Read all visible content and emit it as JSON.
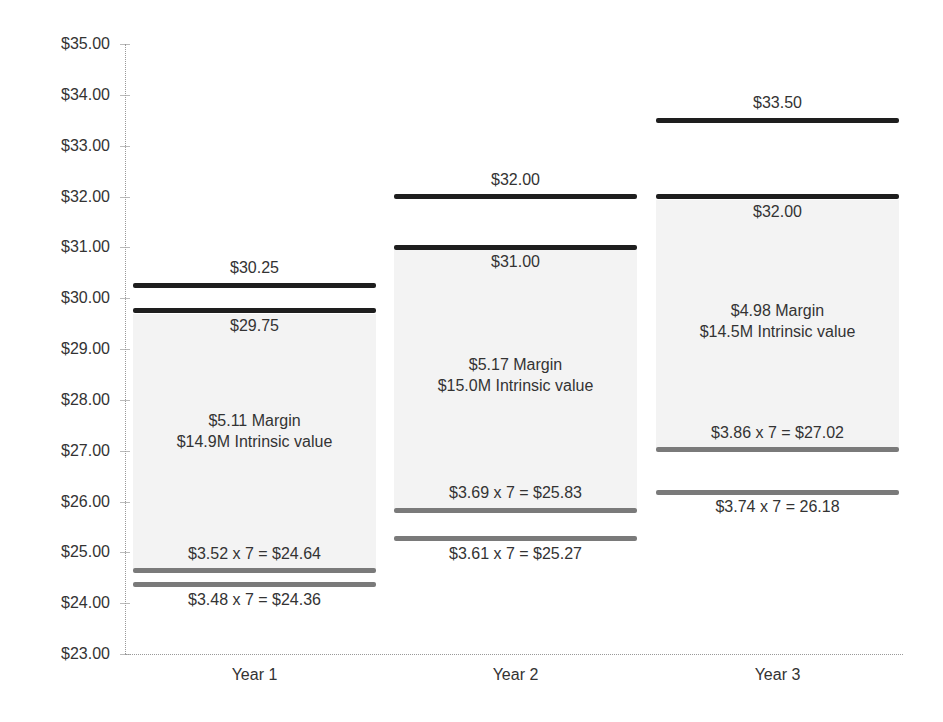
{
  "chart_data": {
    "type": "range-bar",
    "title": "",
    "xlabel": "",
    "ylabel": "",
    "ylim": [
      23,
      35
    ],
    "grid": false,
    "legend": null,
    "y_ticks": [
      "$35.00",
      "$34.00",
      "$33.00",
      "$32.00",
      "$31.00",
      "$30.00",
      "$29.00",
      "$28.00",
      "$27.00",
      "$26.00",
      "$25.00",
      "$24.00",
      "$23.00"
    ],
    "categories": [
      "Year 1",
      "Year 2",
      "Year 3"
    ],
    "series": [
      {
        "name": "Price high",
        "values": [
          30.25,
          32.0,
          33.5
        ],
        "labels": [
          "$30.25",
          "$32.00",
          "$33.50"
        ]
      },
      {
        "name": "Price low",
        "values": [
          29.75,
          31.0,
          32.0
        ],
        "labels": [
          "$29.75",
          "$31.00",
          "$32.00"
        ]
      },
      {
        "name": "Value high (EPS x 7)",
        "values": [
          24.64,
          25.83,
          27.02
        ],
        "labels": [
          "$3.52 x 7 = $24.64",
          "$3.69 x 7 = $25.83",
          "$3.86 x 7 = $27.02"
        ]
      },
      {
        "name": "Value low (EPS x 7)",
        "values": [
          24.36,
          25.27,
          26.18
        ],
        "labels": [
          "$3.48 x 7 = $24.36",
          "$3.61 x 7 = $25.27",
          "$3.74 x 7 = 26.18"
        ]
      }
    ],
    "annotations": [
      {
        "category": "Year 1",
        "margin": "$5.11 Margin",
        "intrinsic": "$14.9M Intrinsic value"
      },
      {
        "category": "Year 2",
        "margin": "$5.17 Margin",
        "intrinsic": "$15.0M Intrinsic value"
      },
      {
        "category": "Year 3",
        "margin": "$4.98 Margin",
        "intrinsic": "$14.5M Intrinsic value"
      }
    ]
  },
  "colors": {
    "price_line": "#1e1e1e",
    "value_line": "#7a7a7a",
    "shade": "#f3f3f3"
  }
}
